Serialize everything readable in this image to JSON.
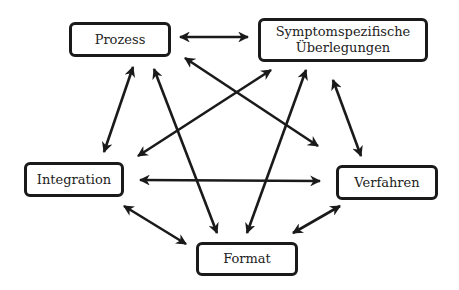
{
  "diagram": {
    "colors": {
      "stroke": "#1a1a1a",
      "text": "#222222",
      "background": "#ffffff"
    },
    "nodes": {
      "prozess": {
        "label": "Prozess"
      },
      "symptom": {
        "line1": "Symptomspezifische",
        "line2": "Überlegungen"
      },
      "integration": {
        "label": "Integration"
      },
      "verfahren": {
        "label": "Verfahren"
      },
      "format": {
        "label": "Format"
      }
    },
    "edges": [
      {
        "from": "Prozess",
        "to": "Symptomspezifische Überlegungen",
        "direction": "both"
      },
      {
        "from": "Prozess",
        "to": "Integration",
        "direction": "both"
      },
      {
        "from": "Prozess",
        "to": "Format",
        "direction": "both"
      },
      {
        "from": "Prozess",
        "to": "Verfahren",
        "direction": "both"
      },
      {
        "from": "Symptomspezifische Überlegungen",
        "to": "Integration",
        "direction": "both"
      },
      {
        "from": "Symptomspezifische Überlegungen",
        "to": "Format",
        "direction": "both"
      },
      {
        "from": "Symptomspezifische Überlegungen",
        "to": "Verfahren",
        "direction": "both"
      },
      {
        "from": "Integration",
        "to": "Verfahren",
        "direction": "both"
      },
      {
        "from": "Integration",
        "to": "Format",
        "direction": "both"
      },
      {
        "from": "Verfahren",
        "to": "Format",
        "direction": "both"
      }
    ]
  }
}
